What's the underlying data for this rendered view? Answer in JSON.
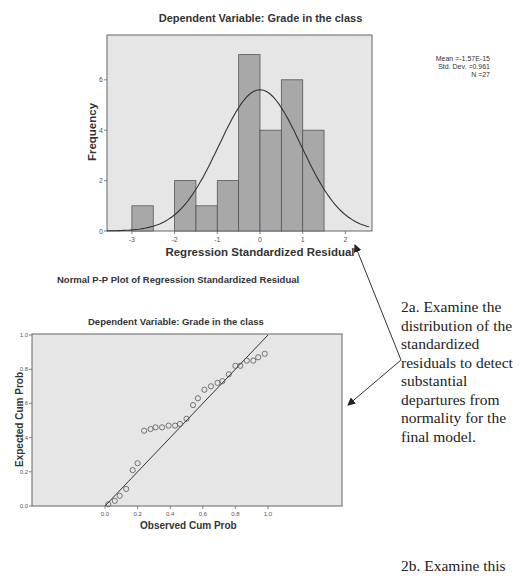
{
  "histogram": {
    "title": "Dependent Variable: Grade in the class",
    "xlabel": "Regression Standardized Residual",
    "ylabel": "Frequency",
    "stats": [
      "Mean =-1.57E-15",
      "Std. Dev. =0.961",
      "N =27"
    ]
  },
  "ppplot": {
    "heading": "Normal P-P Plot of Regression Standardized Residual",
    "title": "Dependent Variable: Grade in the class",
    "xlabel": "Observed Cum Prob",
    "ylabel": "Expected Cum Prob"
  },
  "annotations": {
    "a2": "2a. Examine the distribution of the standardized residuals to detect substantial departures from normality for the final model.",
    "b2": "2b. Examine this"
  },
  "colors": {
    "plot_bg": "#e6e6e6",
    "bar_fill": "#a8a8a8",
    "line": "#333333"
  },
  "chart_data": [
    {
      "type": "bar",
      "title": "Dependent Variable: Grade in the class",
      "xlabel": "Regression Standardized Residual",
      "ylabel": "Frequency",
      "bin_edges": [
        -3.0,
        -2.5,
        -2.0,
        -1.5,
        -1.0,
        -0.5,
        0.0,
        0.5,
        1.0,
        1.5
      ],
      "categories": [
        "-3.0 to -2.5",
        "-2.5 to -2.0",
        "-2.0 to -1.5",
        "-1.5 to -1.0",
        "-1.0 to -0.5",
        "-0.5 to 0.0",
        "0.0 to 0.5",
        "0.5 to 1.0",
        "1.0 to 1.5"
      ],
      "values": [
        1,
        0,
        2,
        1,
        2,
        7,
        4,
        6,
        4
      ],
      "overlay": "normal curve (mean -1.57E-15, sd 0.961, N 27)",
      "xticks": [
        -3,
        -2,
        -1,
        0,
        1,
        2
      ],
      "yticks": [
        0,
        2,
        4,
        6
      ],
      "xlim": [
        -3.7,
        2.5
      ],
      "ylim": [
        0,
        7.8
      ],
      "legend": [
        "Mean =-1.57E-15",
        "Std. Dev. =0.961",
        "N =27"
      ]
    },
    {
      "type": "scatter",
      "title": "Normal P-P Plot of Regression Standardized Residual — Dependent Variable: Grade in the class",
      "xlabel": "Observed Cum Prob",
      "ylabel": "Expected Cum Prob",
      "x": [
        0.02,
        0.06,
        0.09,
        0.13,
        0.17,
        0.2,
        0.24,
        0.28,
        0.31,
        0.35,
        0.39,
        0.43,
        0.46,
        0.5,
        0.54,
        0.57,
        0.61,
        0.65,
        0.69,
        0.72,
        0.76,
        0.8,
        0.83,
        0.87,
        0.91,
        0.94,
        0.98
      ],
      "y": [
        0.01,
        0.03,
        0.06,
        0.1,
        0.21,
        0.25,
        0.44,
        0.45,
        0.46,
        0.46,
        0.47,
        0.47,
        0.48,
        0.51,
        0.59,
        0.63,
        0.68,
        0.7,
        0.72,
        0.73,
        0.77,
        0.82,
        0.82,
        0.85,
        0.85,
        0.87,
        0.89
      ],
      "reference_line": "y = x",
      "xticks": [
        0.0,
        0.2,
        0.4,
        0.6,
        0.8,
        1.0
      ],
      "yticks": [
        0.0,
        0.2,
        0.4,
        0.6,
        0.8,
        1.0
      ],
      "xlim": [
        -0.65,
        1.45
      ],
      "ylim": [
        0,
        1.0
      ]
    }
  ]
}
